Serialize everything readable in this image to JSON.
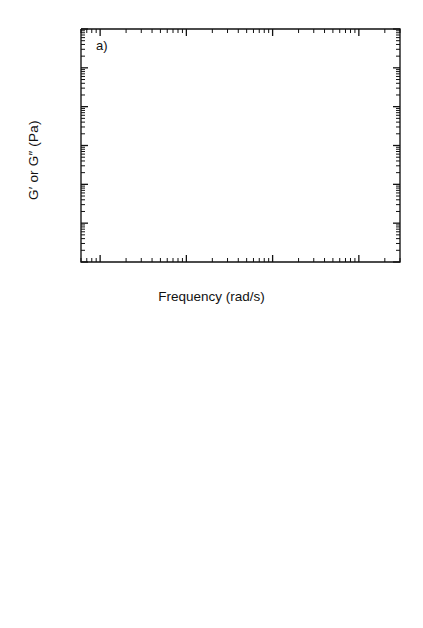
{
  "figure": {
    "background": "#ffffff",
    "ink": "#111111"
  },
  "axes": {
    "xlabel": "Frequency (rad/s)",
    "ylabel": "G′ or G″ (Pa)",
    "x_ticklabels": [
      {
        "mantissa": "10",
        "exponent": "-1",
        "value": 0.1
      },
      {
        "mantissa": "10",
        "exponent": "0",
        "value": 1
      },
      {
        "mantissa": "10",
        "exponent": "1",
        "value": 10
      },
      {
        "mantissa": "10",
        "exponent": "2",
        "value": 100
      }
    ],
    "y_ticklabels": [
      {
        "mantissa": "10",
        "exponent": "",
        "value": 10
      },
      {
        "mantissa": "10",
        "exponent": "3",
        "value": 1000
      },
      {
        "mantissa": "10",
        "exponent": "5",
        "value": 100000
      },
      {
        "mantissa": "10",
        "exponent": "7",
        "value": 10000000
      }
    ],
    "xlim": [
      0.06,
      300
    ],
    "ylim": [
      10,
      10000000
    ],
    "xscale": "log",
    "yscale": "log",
    "grid": false
  },
  "panels": [
    {
      "id": "a",
      "tag": "a)",
      "labels": [
        {
          "name": "pc-label",
          "text": "PC",
          "x": 0.085,
          "y": 200000
        },
        {
          "name": "p01-label",
          "text": "0.1",
          "x": 0.082,
          "y": 20000
        },
        {
          "name": "p05-label",
          "text": "0.5",
          "x": 0.082,
          "y": 3300
        },
        {
          "name": "lcp-label",
          "text": "LCP",
          "x": 0.082,
          "y": 32
        }
      ]
    },
    {
      "id": "b",
      "tag": "b)",
      "labels": [
        {
          "name": "pc-label",
          "text": "P C",
          "x": 175,
          "y": 1150000
        },
        {
          "name": "p01-label",
          "text": "0.1",
          "x": 175,
          "y": 360000
        },
        {
          "name": "p05-label",
          "text": "0.5",
          "x": 175,
          "y": 105000
        },
        {
          "name": "lcp-label",
          "text": "LCP",
          "x": 175,
          "y": 4300
        }
      ]
    }
  ],
  "chart_data": [
    {
      "type": "scatter",
      "panel": "a",
      "title": "a)",
      "xlabel": "Frequency (rad/s)",
      "ylabel": "G′ or G″ (Pa)",
      "xscale": "log",
      "yscale": "log",
      "xlim": [
        0.06,
        300
      ],
      "ylim": [
        10,
        10000000
      ],
      "grid": false,
      "legend_position": "in-plot-left",
      "series": [
        {
          "name": "PC G′",
          "marker": "filled-circle",
          "color": "#111111",
          "x": [
            0.1,
            0.158,
            0.251,
            0.398,
            0.631,
            1.0,
            1.58,
            2.51,
            3.98,
            6.31,
            10.0,
            15.8,
            25.1,
            39.8,
            63.1,
            100.0
          ],
          "y": [
            170000,
            320000,
            400000,
            450000,
            500000,
            560000,
            700000,
            850000,
            1000000,
            1100000,
            1300000,
            1500000,
            1700000,
            1900000,
            2000000,
            2100000
          ]
        },
        {
          "name": "PC G″",
          "marker": "open-circle",
          "color": "#111111",
          "x": [
            0.1,
            0.158,
            0.251,
            0.398,
            0.631,
            1.0,
            1.58,
            2.51,
            3.98,
            6.31,
            10.0,
            15.8,
            25.1,
            39.8,
            63.1,
            100.0
          ],
          "y": [
            250000,
            330000,
            400000,
            450000,
            490000,
            540000,
            600000,
            630000,
            650000,
            650000,
            640000,
            620000,
            600000,
            580000,
            570000,
            560000
          ]
        },
        {
          "name": "0.1 G′",
          "marker": "filled-triangle",
          "color": "#111111",
          "x": [
            0.1,
            0.158,
            0.251,
            0.398,
            0.631,
            1.0,
            1.58,
            2.51,
            3.98,
            6.31,
            10.0,
            15.8,
            25.1,
            39.8,
            63.1,
            100.0
          ],
          "y": [
            17000,
            31000,
            48000,
            62000,
            80000,
            100000,
            140000,
            165000,
            185000,
            200000,
            215000,
            230000,
            245000,
            260000,
            270000,
            280000
          ]
        },
        {
          "name": "0.1 G″",
          "marker": "open-triangle",
          "color": "#111111",
          "x": [
            0.1,
            0.158,
            0.251,
            0.398,
            0.631,
            1.0,
            1.58,
            2.51,
            3.98,
            6.31,
            10.0,
            15.8,
            25.1,
            39.8,
            63.1,
            100.0
          ],
          "y": [
            42000,
            62000,
            80000,
            90000,
            105000,
            115000,
            130000,
            145000,
            155000,
            160000,
            165000,
            170000,
            175000,
            180000,
            185000,
            190000
          ]
        },
        {
          "name": "0.5 G′",
          "marker": "filled-diamond",
          "color": "#111111",
          "x": [
            0.1,
            0.158,
            0.251,
            0.398,
            0.631,
            1.0,
            1.58,
            2.51,
            3.98,
            6.31,
            10.0,
            15.8,
            25.1,
            39.8,
            63.1,
            100.0
          ],
          "y": [
            3000,
            4600,
            5600,
            7000,
            9000,
            11500,
            16000,
            23000,
            33000,
            45000,
            62000,
            75000,
            88000,
            105000,
            125000,
            150000
          ]
        },
        {
          "name": "0.5 G″",
          "marker": "open-diamond",
          "color": "#111111",
          "x": [
            0.1,
            0.158,
            0.251,
            0.398,
            0.631,
            1.0,
            1.58,
            2.51,
            3.98,
            6.31,
            10.0,
            15.8,
            25.1,
            39.8,
            63.1,
            100.0
          ],
          "y": [
            6000,
            7500,
            9000,
            10000,
            13000,
            14000,
            18000,
            25000,
            35000,
            47000,
            63000,
            74000,
            82000,
            88000,
            92000,
            95000
          ]
        },
        {
          "name": "LCP G′",
          "marker": "open-square",
          "color": "#111111",
          "x": [
            0.1,
            0.158,
            0.251,
            0.398,
            0.631,
            1.0,
            1.58,
            2.51,
            3.98,
            6.31,
            10.0,
            15.8,
            25.1,
            39.8,
            63.1,
            100.0
          ],
          "y": [
            105,
            135,
            175,
            225,
            300,
            420,
            580,
            800,
            1100,
            1500,
            2000,
            2700,
            3700,
            4800,
            6200,
            8500
          ]
        },
        {
          "name": "LCP G″",
          "marker": "filled-square",
          "color": "#111111",
          "x": [
            0.1,
            0.158,
            0.251,
            0.398,
            0.631,
            1.0,
            1.58,
            2.51,
            3.98,
            6.31,
            10.0,
            15.8,
            25.1,
            39.8,
            63.1,
            100.0
          ],
          "y": [
            31,
            33,
            42,
            52,
            72,
            105,
            160,
            230,
            330,
            460,
            650,
            950,
            1400,
            2100,
            3000,
            4500
          ]
        }
      ]
    },
    {
      "type": "scatter",
      "panel": "b",
      "title": "b)",
      "xlabel": "Frequency (rad/s)",
      "ylabel": "G′ or G″ (Pa)",
      "xscale": "log",
      "yscale": "log",
      "xlim": [
        0.06,
        300
      ],
      "ylim": [
        10,
        10000000
      ],
      "grid": false,
      "legend_position": "right",
      "series": [
        {
          "name": "PC G′",
          "marker": "filled-circle",
          "color": "#111111",
          "x": [
            0.158,
            0.251,
            0.398,
            0.631,
            1.0,
            1.58,
            2.51,
            3.98,
            6.31,
            10.0,
            15.8,
            25.1,
            39.8,
            63.1,
            100.0
          ],
          "y": [
            8500,
            17000,
            30000,
            50000,
            90000,
            125000,
            185000,
            260000,
            400000,
            500000,
            700000,
            800000,
            900000,
            1000000,
            1150000
          ]
        },
        {
          "name": "PC G″",
          "marker": "open-circle",
          "color": "#111111",
          "x": [
            0.1,
            0.158,
            0.251,
            0.398,
            0.631,
            1.0,
            1.58,
            2.51,
            3.98,
            6.31,
            10.0,
            15.8,
            25.1,
            39.8,
            63.1,
            100.0
          ],
          "y": [
            30000,
            45000,
            62000,
            95000,
            125000,
            175000,
            225000,
            270000,
            300000,
            400000,
            480000,
            570000,
            620000,
            680000,
            700000
          ]
        },
        {
          "name": "0.1 G′",
          "marker": "filled-triangle",
          "color": "#111111",
          "x": [
            0.1,
            0.158,
            0.251,
            0.398,
            0.631,
            1.0,
            1.58,
            2.51,
            3.98,
            6.31,
            10.0,
            15.8,
            25.1,
            39.8,
            63.1,
            100.0
          ],
          "y": [
            1700,
            2600,
            4700,
            5600,
            9000,
            14000,
            22000,
            34000,
            52000,
            80000,
            120000,
            180000,
            230000,
            300000,
            360000
          ]
        },
        {
          "name": "0.1 G″",
          "marker": "open-triangle",
          "color": "#111111",
          "x": [
            0.1,
            0.158,
            0.251,
            0.398,
            0.631,
            1.0,
            1.58,
            2.51,
            3.98,
            6.31,
            10.0,
            15.8,
            25.1,
            39.8,
            63.1,
            100.0
          ],
          "y": [
            2100,
            3200,
            4400,
            6200,
            11000,
            16000,
            26000,
            40000,
            62000,
            90000,
            130000,
            180000,
            230000,
            280000,
            320000
          ]
        },
        {
          "name": "0.5 G′",
          "marker": "filled-diamond",
          "color": "#111111",
          "x": [
            0.1,
            0.158,
            0.251,
            0.398,
            0.631,
            1.0,
            1.58,
            2.51,
            3.98,
            6.31,
            10.0,
            15.8,
            25.1,
            39.8,
            63.1,
            100.0
          ],
          "y": [
            950,
            1100,
            1700,
            2300,
            3500,
            4500,
            7500,
            11500,
            16000,
            22000,
            30000,
            50000,
            62000,
            75000,
            95000
          ]
        },
        {
          "name": "0.5 G″",
          "marker": "open-diamond",
          "color": "#111111",
          "x": [
            0.1,
            0.158,
            0.251,
            0.398,
            0.631,
            1.0,
            1.58,
            2.51,
            3.98,
            6.31,
            10.0,
            15.8,
            25.1,
            39.8,
            63.1,
            100.0
          ],
          "y": [
            1400,
            2200,
            3700,
            5000,
            8000,
            12000,
            15000,
            20000,
            28000,
            40000,
            52000,
            62000,
            75000,
            88000,
            100000
          ]
        },
        {
          "name": "LCP G′",
          "marker": "open-square",
          "color": "#111111",
          "x": [
            0.1,
            0.158,
            0.251,
            0.398,
            0.631,
            1.0,
            1.58,
            2.51,
            3.98,
            6.31,
            10.0,
            15.8,
            25.1,
            39.8,
            63.1,
            100.0
          ],
          "y": [
            45,
            55,
            85,
            110,
            135,
            230,
            330,
            480,
            700,
            1000,
            1500,
            2300,
            3300,
            4300,
            6200
          ]
        },
        {
          "name": "LCP G″",
          "marker": "filled-square",
          "color": "#111111",
          "x": [
            0.1,
            0.158,
            0.251,
            0.398,
            0.631,
            1.0,
            1.58,
            2.51,
            3.98,
            6.31,
            10.0,
            15.8,
            25.1,
            39.8,
            63.1,
            100.0
          ],
          "y": [
            18,
            19,
            25,
            31,
            36,
            48,
            68,
            100,
            160,
            230,
            350,
            520,
            800,
            1300,
            2000
          ]
        }
      ],
      "error_bars": [
        {
          "series": "PC G′",
          "x": 6.31,
          "y": 400000,
          "y_low": 300000,
          "y_high": 620000
        },
        {
          "series": "0.1 G′",
          "x": 15.8,
          "y": 120000,
          "y_low": 92000,
          "y_high": 175000
        },
        {
          "series": "0.5 G″",
          "x": 39.8,
          "y": 75000,
          "y_low": 42000,
          "y_high": 100000
        }
      ]
    }
  ]
}
